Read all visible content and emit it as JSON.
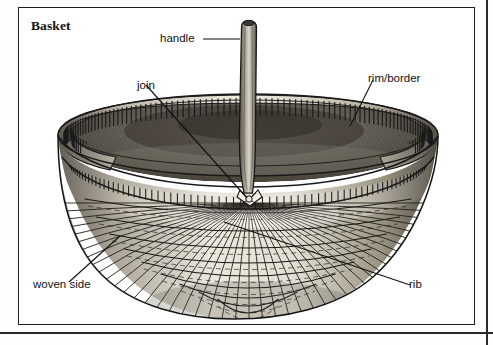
{
  "page": {
    "title": "Basket",
    "domain": "illustrated-dictionary-plate",
    "background_color": "#ffffff",
    "ink_color": "#1c1c1c"
  },
  "frame": {
    "inner_border_color": "#1c1c1c",
    "outer_rule_color": "#2a2a2a"
  },
  "labels": [
    {
      "id": "handle",
      "text": "handle",
      "leader": "horizontal-right"
    },
    {
      "id": "join",
      "text": "join",
      "leader": "diagonal-down-right"
    },
    {
      "id": "rim_border",
      "text": "rim/border",
      "leader": "diagonal-down-left"
    },
    {
      "id": "woven_side",
      "text": "woven side",
      "leader": "diagonal-up-right"
    },
    {
      "id": "rib",
      "text": "rib",
      "leader": "diagonal-up-left"
    }
  ],
  "illustration": {
    "subject": "woven splint gathering basket with bentwood handle",
    "technique": "pen-and-ink / graphite hatching engraving",
    "parts": [
      "handle",
      "join",
      "rim/border",
      "woven side",
      "rib"
    ],
    "tones": {
      "interior_shadow": "#5a564f",
      "splint_light": "#efece5",
      "splint_mid": "#b9b4aa",
      "splint_dark": "#46423b",
      "outline": "#1a1a1a"
    }
  }
}
